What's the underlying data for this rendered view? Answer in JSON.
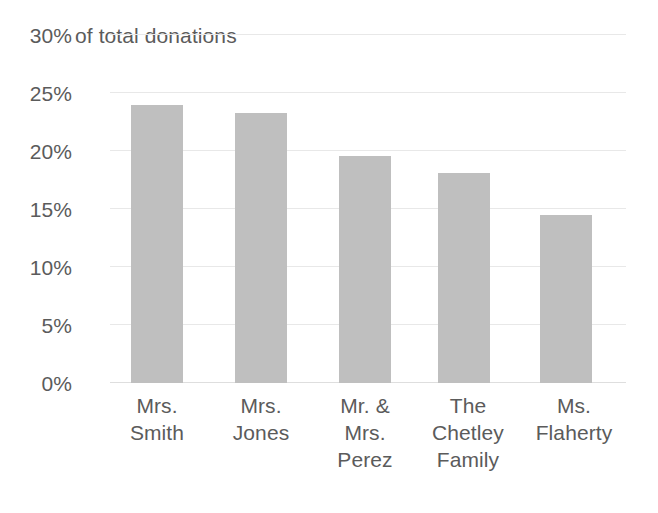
{
  "chart_data": {
    "type": "bar",
    "title": "",
    "axis_title": "of total donations",
    "xlabel": "",
    "ylabel": "of total donations",
    "categories": [
      "Mrs. Smith",
      "Mrs. Jones",
      "Mr. & Mrs. Perez",
      "The Chetley Family",
      "Ms. Flaherty"
    ],
    "category_lines": [
      [
        "Mrs.",
        "Smith"
      ],
      [
        "Mrs.",
        "Jones"
      ],
      [
        "Mr. &",
        "Mrs.",
        "Perez"
      ],
      [
        "The",
        "Chetley",
        "Family"
      ],
      [
        "Ms.",
        "Flaherty"
      ]
    ],
    "values": [
      24.0,
      23.3,
      19.6,
      18.1,
      14.5
    ],
    "value_labels": [
      "24%",
      "23.3%",
      "19.6%",
      "18.1%",
      "14.5%"
    ],
    "ylim": [
      0,
      30
    ],
    "ytick_labels": [
      "30%",
      "25%",
      "20%",
      "15%",
      "10%",
      "5%",
      "0%"
    ],
    "ytick_values": [
      30,
      25,
      20,
      15,
      10,
      5,
      0
    ],
    "grid": true,
    "legend": false,
    "legend_position": "none",
    "series": [
      {
        "name": "of total donations",
        "values": [
          24.0,
          23.3,
          19.6,
          18.1,
          14.5
        ]
      }
    ],
    "colors": {
      "bar_fill": "#bfbfbf",
      "gridline": "#e8e8e8",
      "baseline": "#dedede",
      "text": "#5b5b5b",
      "background": "#ffffff"
    }
  }
}
